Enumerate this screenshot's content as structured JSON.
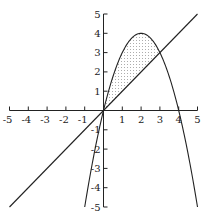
{
  "chart_data": {
    "type": "line",
    "title": "",
    "xlabel": "",
    "ylabel": "",
    "xlim": [
      -5,
      5
    ],
    "ylim": [
      -5,
      5
    ],
    "grid": false,
    "x_ticks": [
      -5,
      -4,
      -3,
      -2,
      -1,
      1,
      2,
      3,
      4,
      5
    ],
    "y_ticks": [
      -5,
      -4,
      -3,
      -2,
      -1,
      1,
      2,
      3,
      4,
      5
    ],
    "series": [
      {
        "name": "parabola",
        "equation": "y = 4x - x^2",
        "x_range": [
          -1,
          5
        ],
        "points": [
          [
            -1,
            -5
          ],
          [
            0,
            0
          ],
          [
            1,
            3
          ],
          [
            2,
            4
          ],
          [
            3,
            3
          ],
          [
            4,
            0
          ],
          [
            5,
            -5
          ]
        ]
      },
      {
        "name": "line",
        "equation": "y = x",
        "x_range": [
          -5,
          5
        ],
        "points": [
          [
            -5,
            -5
          ],
          [
            0,
            0
          ],
          [
            3,
            3
          ],
          [
            5,
            5
          ]
        ]
      }
    ],
    "shaded_region": {
      "description": "region between y = 4x - x^2 and y = x",
      "x_range": [
        0,
        3
      ],
      "pattern": "dotted"
    },
    "intersections": [
      [
        0,
        0
      ],
      [
        3,
        3
      ]
    ]
  },
  "colors": {
    "stroke": "#222222",
    "fill_dots": "#555555",
    "background": "#ffffff"
  }
}
